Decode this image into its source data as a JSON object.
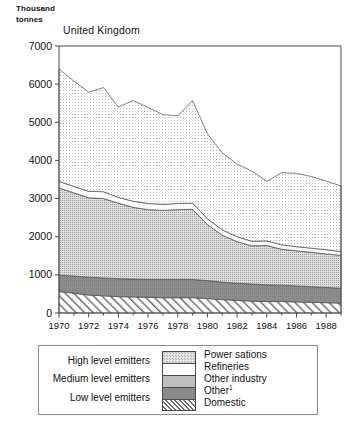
{
  "axis_unit_caption": "Thousand\ntonnes",
  "chart_data": {
    "type": "area",
    "stacked": true,
    "title": "United Kingdom",
    "xlabel": "",
    "ylabel": "Thousand tonnes",
    "ylim": [
      0,
      7000
    ],
    "yticks": [
      0,
      1000,
      2000,
      3000,
      4000,
      5000,
      6000,
      7000
    ],
    "ytick_labels": [
      "0",
      "1000",
      "2000",
      "3000",
      "4000",
      "5000",
      "6000",
      "7000"
    ],
    "xlim": [
      1970,
      1989
    ],
    "xticks": [
      1970,
      1972,
      1974,
      1976,
      1978,
      1980,
      1982,
      1984,
      1986,
      1988
    ],
    "xtick_labels": [
      "1970",
      "1972",
      "1974",
      "1976",
      "1978",
      "1980",
      "1982",
      "1984",
      "1986",
      "1988"
    ],
    "minor_xticks": [
      1971,
      1973,
      1975,
      1977,
      1979,
      1981,
      1983,
      1985,
      1987,
      1989
    ],
    "grid": false,
    "legend_position": "below",
    "x": [
      1970,
      1971,
      1972,
      1973,
      1974,
      1975,
      1976,
      1977,
      1978,
      1979,
      1980,
      1981,
      1982,
      1983,
      1984,
      1985,
      1986,
      1987,
      1988,
      1989
    ],
    "series": [
      {
        "name": "Domestic",
        "order": 1,
        "fill": "diagonal-hatch",
        "values": [
          560,
          520,
          470,
          450,
          430,
          420,
          410,
          400,
          400,
          400,
          380,
          350,
          330,
          310,
          300,
          300,
          290,
          280,
          270,
          260
        ]
      },
      {
        "name": "Other",
        "order": 2,
        "fill": "dark-gray",
        "values": [
          430,
          450,
          470,
          470,
          470,
          470,
          470,
          480,
          480,
          480,
          470,
          460,
          450,
          450,
          440,
          430,
          420,
          410,
          400,
          390
        ]
      },
      {
        "name": "Other industry",
        "order": 3,
        "fill": "medium-dot",
        "values": [
          2290,
          2180,
          2080,
          2080,
          1980,
          1880,
          1830,
          1810,
          1830,
          1840,
          1470,
          1230,
          1090,
          1000,
          1030,
          940,
          920,
          900,
          880,
          860
        ]
      },
      {
        "name": "Refineries",
        "order": 4,
        "fill": "white",
        "values": [
          170,
          170,
          170,
          180,
          150,
          160,
          160,
          160,
          160,
          160,
          150,
          140,
          130,
          120,
          120,
          120,
          110,
          110,
          110,
          100
        ]
      },
      {
        "name": "Power sations",
        "order": 5,
        "fill": "light-dot",
        "values": [
          2950,
          2760,
          2600,
          2730,
          2370,
          2640,
          2520,
          2350,
          2300,
          2690,
          2230,
          2020,
          1900,
          1840,
          1560,
          1890,
          1920,
          1880,
          1800,
          1720
        ]
      }
    ],
    "totals": [
      6400,
      6080,
      5790,
      5910,
      5400,
      5570,
      5390,
      5200,
      5170,
      5570,
      4700,
      4200,
      3900,
      3720,
      3450,
      3680,
      3660,
      3580,
      3460,
      3330
    ]
  },
  "legend": {
    "levels": [
      {
        "label": "High level emitters"
      },
      {
        "label": "Medium level emitters"
      },
      {
        "label": "Low level emitters"
      }
    ],
    "keys": [
      {
        "label": "Power sations",
        "fill": "light-dot",
        "footnote": ""
      },
      {
        "label": "Refineries",
        "fill": "white",
        "footnote": ""
      },
      {
        "label": "Other industry",
        "fill": "medium-dot",
        "footnote": ""
      },
      {
        "label": "Other",
        "fill": "dark-gray",
        "footnote": "1"
      },
      {
        "label": "Domestic",
        "fill": "diagonal-hatch",
        "footnote": ""
      }
    ]
  }
}
